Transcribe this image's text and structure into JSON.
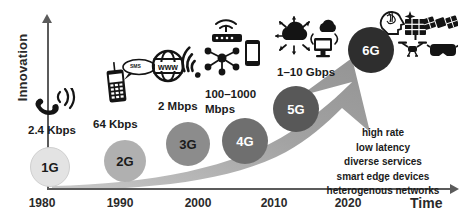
{
  "axes": {
    "y_label": "Innovation",
    "x_label": "Time",
    "x_ticks": [
      "1980",
      "1990",
      "2000",
      "2010",
      "2020"
    ]
  },
  "generations": [
    {
      "id": "1g",
      "label": "1G",
      "speed": "2.4 Kbps",
      "year": "1980",
      "bubble_color": "#e3e3e3",
      "text_color": "#1b1b1b",
      "icons": [
        "phone-handset-icon",
        "signal-waves-icon"
      ]
    },
    {
      "id": "2g",
      "label": "2G",
      "speed": "64 Kbps",
      "year": "1990",
      "bubble_color": "#b0b0b0",
      "text_color": "#1b1b1b",
      "icons": [
        "feature-phone-icon",
        "sms-bubble-icon"
      ],
      "sms_label": "SMS"
    },
    {
      "id": "3g",
      "label": "3G",
      "speed": "2 Mbps",
      "year": "2000",
      "bubble_color": "#8c8c8c",
      "text_color": "#1b1b1b",
      "icons": [
        "www-globe-icon",
        "wifi-signal-icon"
      ]
    },
    {
      "id": "4g",
      "label": "4G",
      "speed": "100–1000 Mbps",
      "speed_line1": "100–1000",
      "speed_line2": "Mbps",
      "year": "2010",
      "bubble_color": "#6f6f6f",
      "text_color": "#ffffff",
      "icons": [
        "wifi-router-icon",
        "smartphone-icon",
        "network-nodes-icon"
      ]
    },
    {
      "id": "5g",
      "label": "5G",
      "speed": "1–10 Gbps",
      "year": "2020",
      "bubble_color": "#585858",
      "text_color": "#ffffff",
      "icons": [
        "iot-cloud-icon",
        "desktop-monitor-icon",
        "cloud-icon"
      ]
    },
    {
      "id": "6g",
      "label": "6G",
      "speed": "",
      "year": "",
      "bubble_color": "#2e2e2e",
      "text_color": "#ffffff",
      "icons": [
        "ai-brain-icon",
        "solar-panel-icon",
        "satellite-icon",
        "drone-icon",
        "vr-headset-icon"
      ]
    }
  ],
  "features": {
    "items": [
      "high rate",
      "low latency",
      "diverse services",
      "smart edge devices",
      "heterogenous networks"
    ],
    "ellipsis": "..."
  },
  "colors": {
    "arrow": "#9a9a9a",
    "axis": "#5b5b5b",
    "text": "#1b1b1b",
    "background": "#ffffff"
  }
}
